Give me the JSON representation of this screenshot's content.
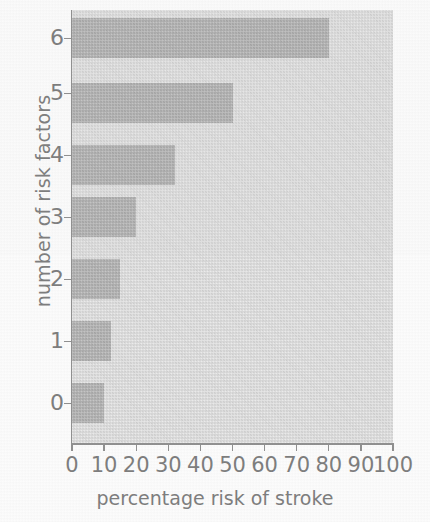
{
  "chart_data": {
    "type": "bar",
    "orientation": "horizontal",
    "title": "",
    "xlabel": "percentage risk of stroke",
    "ylabel": "number of risk factors",
    "categories": [
      "0",
      "1",
      "2",
      "3",
      "4",
      "5",
      "6"
    ],
    "values": [
      10,
      12,
      15,
      20,
      32,
      50,
      80
    ],
    "xlim": [
      0,
      100
    ],
    "xticks": [
      "0",
      "10",
      "20",
      "30",
      "40",
      "50",
      "60",
      "70",
      "80",
      "90",
      "100"
    ],
    "xtick_values": [
      0,
      10,
      20,
      30,
      40,
      50,
      60,
      70,
      80,
      90,
      100
    ],
    "yticks": [
      "0",
      "1",
      "2",
      "3",
      "4",
      "5",
      "6"
    ],
    "grid": false,
    "legend": null,
    "colors": {
      "bar": "#a9a9a9",
      "plot_background": "#e3e3e3",
      "page_background": "#fdfdfd",
      "text": "#7b7b7b",
      "axis": "#8e8e8e"
    }
  }
}
